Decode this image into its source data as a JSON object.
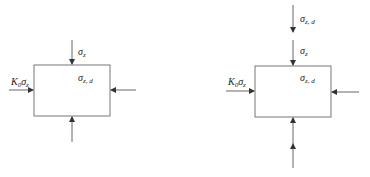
{
  "diagrams": [
    {
      "name": "left-element",
      "top_label": {
        "symbol": "σ",
        "sub": "z"
      },
      "inner_label": {
        "symbol": "σ",
        "sub": "z, d"
      },
      "left_label": {
        "coef": "K",
        "coef_sub": "0",
        "symbol": "σ",
        "sub": "z"
      }
    },
    {
      "name": "right-element",
      "extra_top_label": {
        "symbol": "σ",
        "sub": "z, d"
      },
      "top_label": {
        "symbol": "σ",
        "sub": "z"
      },
      "inner_label": {
        "symbol": "σ",
        "sub": "z, d"
      },
      "left_label": {
        "coef": "K",
        "coef_sub": "0",
        "symbol": "σ",
        "sub": "z"
      }
    }
  ],
  "colors": {
    "line": "#666666",
    "box": "#777777",
    "text": "#222222"
  }
}
